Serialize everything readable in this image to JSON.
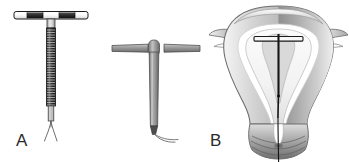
{
  "figure": {
    "background_color": "#ffffff",
    "width": 349,
    "height": 162
  },
  "panels": [
    {
      "id": "a",
      "label": "A",
      "name": "copper-iud",
      "description": "Copper intrauterine device with coiled copper wire wound around the vertical stem, horizontal T-arm with white tips and dark inner bands, and two fine monofilament threads at the base",
      "colors": {
        "arm_fill": "#ffffff",
        "arm_band": "#3a3a3a",
        "arm_outline": "#1f1f1f",
        "coil": "#2e2e2e",
        "stem": "#d8d8d8",
        "thread": "#5a5a5a"
      },
      "coil_turns": 31
    },
    {
      "id": "b",
      "label": "B",
      "name": "hormonal-iud",
      "description": "Hormonal T-shaped intrauterine device with smooth gray arms, tapered vertical stem with hormone reservoir, and a single curved retrieval thread at the base",
      "colors": {
        "body_light": "#b4b4b4",
        "body_mid": "#8d8d8d",
        "body_dark": "#5e5e5e",
        "outline": "#4a4a4a",
        "thread": "#6b6b6b"
      }
    },
    {
      "id": "c",
      "label": "C",
      "name": "uterus-cross-section-with-iud",
      "description": "Coronal cross-section of the uterus showing the IUD positioned within the endometrial cavity, with fallopian tubes, myometrium, cervix, and the retrieval string passing through the cervical canal into the vagina",
      "colors": {
        "myometrium_light": "#e8e8e8",
        "myometrium_mid": "#bdbdbd",
        "myometrium_dark": "#8f8f8f",
        "cavity_lining": "#fcfcfc",
        "outline": "#6e6e6e",
        "iud": "#1a1a1a",
        "cervix_shadow": "#707070"
      },
      "anatomy_parts": [
        "uterine fundus",
        "fallopian tube",
        "myometrium",
        "endometrial cavity",
        "cervix",
        "external os",
        "vaginal wall"
      ]
    }
  ]
}
